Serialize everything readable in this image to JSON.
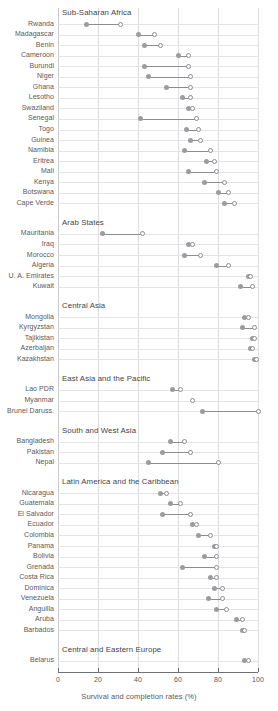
{
  "chart_data": {
    "type": "scatter",
    "title": "",
    "xlabel": "Survival and completion rates (%)",
    "ylabel": "",
    "xlim": [
      0,
      100
    ],
    "xticks": [
      0,
      20,
      40,
      60,
      80,
      100
    ],
    "xtick_labels": [
      "0",
      "20",
      "40",
      "60",
      "80",
      "100"
    ],
    "grid": true,
    "legend_position": "none",
    "series": [
      {
        "name": "survival-rate-filled",
        "marker": "filled-circle",
        "color": "#9a9c9f"
      },
      {
        "name": "completion-rate-open",
        "marker": "open-circle",
        "color": "#8b8d90"
      }
    ],
    "groups": [
      {
        "name": "Sub-Saharan Africa",
        "rows": [
          {
            "label": "Rwanda",
            "filled": 14,
            "open": 31
          },
          {
            "label": "Madagascar",
            "filled": 40,
            "open": 48
          },
          {
            "label": "Benin",
            "filled": 43,
            "open": 51
          },
          {
            "label": "Cameroon",
            "filled": 60,
            "open": 65
          },
          {
            "label": "Burundi",
            "filled": 43,
            "open": 65
          },
          {
            "label": "Niger",
            "filled": 45,
            "open": 66
          },
          {
            "label": "Ghana",
            "filled": 54,
            "open": 66
          },
          {
            "label": "Lesotho",
            "filled": 62,
            "open": 66
          },
          {
            "label": "Swaziland",
            "filled": 65,
            "open": 67
          },
          {
            "label": "Senegal",
            "filled": 41,
            "open": 69
          },
          {
            "label": "Togo",
            "filled": 64,
            "open": 70
          },
          {
            "label": "Guinea",
            "filled": 66,
            "open": 71
          },
          {
            "label": "Namibia",
            "filled": 63,
            "open": 76
          },
          {
            "label": "Eritrea",
            "filled": 74,
            "open": 78
          },
          {
            "label": "Mali",
            "filled": 65,
            "open": 79
          },
          {
            "label": "Kenya",
            "filled": 73,
            "open": 83
          },
          {
            "label": "Botswana",
            "filled": 80,
            "open": 85
          },
          {
            "label": "Cape Verde",
            "filled": 83,
            "open": 88
          }
        ]
      },
      {
        "name": "Arab States",
        "rows": [
          {
            "label": "Mauritania",
            "filled": 22,
            "open": 42
          },
          {
            "label": "Iraq",
            "filled": 65,
            "open": 67
          },
          {
            "label": "Morocco",
            "filled": 63,
            "open": 71
          },
          {
            "label": "Algeria",
            "filled": 79,
            "open": 85
          },
          {
            "label": "U. A. Emirates",
            "filled": 95,
            "open": 96
          },
          {
            "label": "Kuwait",
            "filled": 91,
            "open": 97
          }
        ]
      },
      {
        "name": "Central Asia",
        "rows": [
          {
            "label": "Mongolia",
            "filled": 93,
            "open": 95
          },
          {
            "label": "Kyrgyzstan",
            "filled": 92,
            "open": 98
          },
          {
            "label": "Tajikistan",
            "filled": 97,
            "open": 98
          },
          {
            "label": "Azerbaijan",
            "filled": 96,
            "open": 97
          },
          {
            "label": "Kazakhstan",
            "filled": 98,
            "open": 99
          }
        ]
      },
      {
        "name": "East Asia and the Pacific",
        "rows": [
          {
            "label": "Lao PDR",
            "filled": 57,
            "open": 61
          },
          {
            "label": "Myanmar",
            "filled": null,
            "open": 67
          },
          {
            "label": "Brunei Daruss.",
            "filled": 72,
            "open": 100
          }
        ]
      },
      {
        "name": "South and West Asia",
        "rows": [
          {
            "label": "Bangladesh",
            "filled": 56,
            "open": 63
          },
          {
            "label": "Pakistan",
            "filled": 52,
            "open": 66
          },
          {
            "label": "Nepal",
            "filled": 45,
            "open": 80
          }
        ]
      },
      {
        "name": "Latin America and the Caribbean",
        "rows": [
          {
            "label": "Nicaragua",
            "filled": 51,
            "open": 54
          },
          {
            "label": "Guatemala",
            "filled": 56,
            "open": 61
          },
          {
            "label": "El Salvador",
            "filled": 52,
            "open": 66
          },
          {
            "label": "Ecuador",
            "filled": 67,
            "open": 69
          },
          {
            "label": "Colombia",
            "filled": 70,
            "open": 76
          },
          {
            "label": "Panama",
            "filled": 78,
            "open": 79
          },
          {
            "label": "Bolivia",
            "filled": 73,
            "open": 79
          },
          {
            "label": "Grenada",
            "filled": 62,
            "open": 79
          },
          {
            "label": "Costa Rica",
            "filled": 76,
            "open": 79
          },
          {
            "label": "Dominica",
            "filled": 78,
            "open": 82
          },
          {
            "label": "Venezuela",
            "filled": 75,
            "open": 82
          },
          {
            "label": "Anguilla",
            "filled": 79,
            "open": 84
          },
          {
            "label": "Aruba",
            "filled": 89,
            "open": 92
          },
          {
            "label": "Barbados",
            "filled": 92,
            "open": 93
          }
        ]
      },
      {
        "name": "Central and Eastern Europe",
        "rows": [
          {
            "label": "Belarus",
            "filled": 93,
            "open": 95
          }
        ]
      }
    ]
  }
}
